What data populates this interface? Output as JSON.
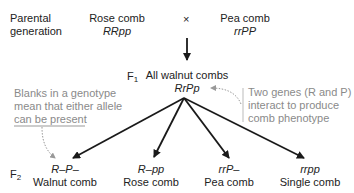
{
  "parental": {
    "label_line1": "Parental",
    "label_line2": "generation",
    "parent1": {
      "phenotype": "Rose comb",
      "genotype": "RRpp"
    },
    "cross_symbol": "×",
    "parent2": {
      "phenotype": "Pea comb",
      "genotype": "rrPP"
    }
  },
  "f1": {
    "label": "F",
    "label_sub": "1",
    "phenotype": "All walnut combs",
    "genotype": "RrPp"
  },
  "annotations": {
    "left": {
      "line1": "Blanks in a genotype",
      "line2": "mean that either allele",
      "line3": "can be present"
    },
    "right": {
      "line1": "Two genes (R and P)",
      "line2": "interact to produce",
      "line3": "comb phenotype"
    }
  },
  "f2": {
    "label": "F",
    "label_sub": "2",
    "offspring": [
      {
        "genotype": "R–P–",
        "phenotype": "Walnut comb"
      },
      {
        "genotype": "R–pp",
        "phenotype": "Rose comb"
      },
      {
        "genotype": "rrP–",
        "phenotype": "Pea comb"
      },
      {
        "genotype": "rrpp",
        "phenotype": "Single comb"
      }
    ]
  },
  "colors": {
    "text": "#222222",
    "annotation": "#8a8a8a",
    "arrow": "#1a1a1a"
  }
}
